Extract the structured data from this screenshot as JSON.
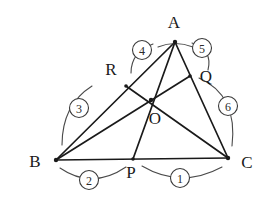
{
  "figure": {
    "background_color": "#ffffff",
    "line_color": "#1a1a1a",
    "arc_color": "#4a4a4a",
    "points": [
      {
        "name": "A",
        "label": "A",
        "x": 175,
        "y": 42,
        "label_x": 174,
        "label_y": 24
      },
      {
        "name": "B",
        "label": "B",
        "x": 56,
        "y": 160,
        "label_x": 35,
        "label_y": 163
      },
      {
        "name": "C",
        "label": "C",
        "x": 228,
        "y": 158,
        "label_x": 247,
        "label_y": 164
      },
      {
        "name": "O",
        "label": "O",
        "x": 151,
        "y": 100,
        "label_x": 155,
        "label_y": 120
      },
      {
        "name": "P",
        "label": "P",
        "x": 133,
        "y": 159,
        "label_x": 131,
        "label_y": 174
      },
      {
        "name": "Q",
        "label": "Q",
        "x": 190,
        "y": 76,
        "label_x": 206,
        "label_y": 78
      },
      {
        "name": "R",
        "label": "R",
        "x": 126,
        "y": 86,
        "label_x": 111,
        "label_y": 71
      }
    ],
    "segments": [
      {
        "name": "side-AB",
        "from": "A",
        "to": "B"
      },
      {
        "name": "side-BC",
        "from": "B",
        "to": "C"
      },
      {
        "name": "side-CA",
        "from": "C",
        "to": "A"
      },
      {
        "name": "cevian-AP",
        "from": "A",
        "to": "P"
      },
      {
        "name": "cevian-BQ",
        "from": "B",
        "to": "Q"
      },
      {
        "name": "cevian-CR",
        "from": "C",
        "to": "R"
      }
    ],
    "numbered_arcs": [
      {
        "id": 1,
        "label": "1",
        "circle_x": 180,
        "circle_y": 178,
        "arc": "M 142 166 Q 181 189 222 167"
      },
      {
        "id": 2,
        "label": "2",
        "circle_x": 89,
        "circle_y": 180,
        "arc": "M 60 168 Q 92 190 126 167"
      },
      {
        "id": 3,
        "label": "3",
        "circle_x": 79,
        "circle_y": 108,
        "arc": "M 62 145 Q 62 105 92 86"
      },
      {
        "id": 4,
        "label": "4",
        "circle_x": 142,
        "circle_y": 50,
        "arc": "M 131 73 Q 131 52 153 44"
      },
      {
        "id": 5,
        "label": "5",
        "circle_x": 202,
        "circle_y": 48,
        "arc": "M 192 43 Q 213 50 208 70"
      },
      {
        "id": 6,
        "label": "6",
        "circle_x": 228,
        "circle_y": 106,
        "arc": "M 199 78 Q 238 95 232 146"
      }
    ],
    "vertex_arcs": [
      {
        "name": "angle-mark-A",
        "path": "M 158 47 Q 175 40 193 47"
      }
    ]
  }
}
